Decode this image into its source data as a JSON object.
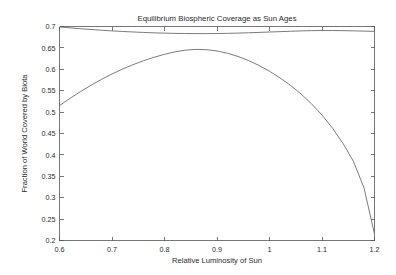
{
  "chart_data": {
    "type": "line",
    "title": "Equilibrium Biospheric Coverage as Sun Ages",
    "xlabel": "Relative Luminosity of Sun",
    "ylabel": "Fraction of World Covered by Biota",
    "xlim": [
      0.6,
      1.2
    ],
    "ylim": [
      0.2,
      0.7
    ],
    "xticks": [
      0.6,
      0.7,
      0.8,
      0.9,
      1.0,
      1.1,
      1.2
    ],
    "xticklabels": [
      "0.6",
      "0.7",
      "0.8",
      "0.9",
      "1",
      "1.1",
      "1.2"
    ],
    "yticks": [
      0.2,
      0.25,
      0.3,
      0.35,
      0.4,
      0.45,
      0.5,
      0.55,
      0.6,
      0.65,
      0.7
    ],
    "yticklabels": [
      "0.2",
      "0.25",
      "0.3",
      "0.35",
      "0.4",
      "0.45",
      "0.5",
      "0.55",
      "0.6",
      "0.65",
      "0.7"
    ],
    "grid": false,
    "legend": null,
    "box": true,
    "line_color": "#6b6b74",
    "axis_color": "#555555",
    "background": "#ffffff",
    "x": [
      0.6,
      0.62,
      0.64,
      0.66,
      0.68,
      0.7,
      0.72,
      0.74,
      0.76,
      0.78,
      0.8,
      0.82,
      0.84,
      0.86,
      0.88,
      0.9,
      0.92,
      0.94,
      0.96,
      0.98,
      1.0,
      1.02,
      1.04,
      1.06,
      1.08,
      1.1,
      1.12,
      1.14,
      1.16,
      1.18,
      1.2
    ],
    "series": [
      {
        "name": "upper-flat-curve",
        "values": [
          0.699,
          0.6968,
          0.6948,
          0.693,
          0.6913,
          0.6898,
          0.6884,
          0.6872,
          0.6861,
          0.6852,
          0.6845,
          0.6839,
          0.6836,
          0.6834,
          0.6834,
          0.6836,
          0.684,
          0.6846,
          0.6853,
          0.6862,
          0.6871,
          0.688,
          0.6889,
          0.6897,
          0.6903,
          0.6906,
          0.6906,
          0.6903,
          0.6898,
          0.6892,
          0.6886
        ]
      },
      {
        "name": "peaked-declining-curve",
        "values": [
          0.515,
          0.532,
          0.548,
          0.5628,
          0.5765,
          0.589,
          0.6005,
          0.6108,
          0.62,
          0.6281,
          0.635,
          0.6408,
          0.6448,
          0.6465,
          0.6458,
          0.6428,
          0.6375,
          0.63,
          0.6205,
          0.609,
          0.5955,
          0.58,
          0.5625,
          0.5425,
          0.5195,
          0.493,
          0.4625,
          0.427,
          0.3845,
          0.323,
          0.215
        ]
      }
    ],
    "annotations": [
      {
        "name": "faint-watermark",
        "text": "",
        "x": 1.08,
        "y": 0.662
      }
    ]
  }
}
